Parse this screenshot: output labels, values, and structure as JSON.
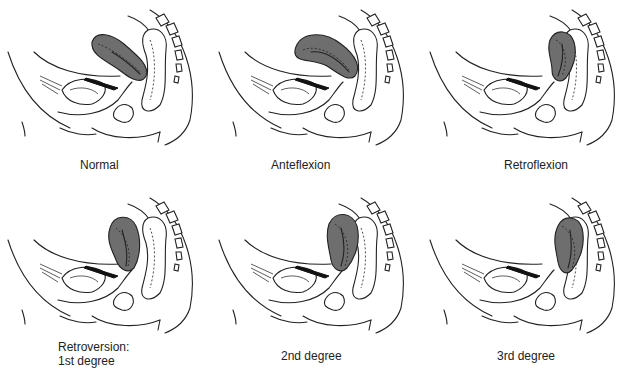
{
  "figure": {
    "panels": [
      {
        "id": "normal",
        "label": "Normal",
        "uterus_position": "normal"
      },
      {
        "id": "anteflexion",
        "label": "Anteflexion",
        "uterus_position": "anteflexion"
      },
      {
        "id": "retroflexion",
        "label": "Retroflexion",
        "uterus_position": "retroflexion"
      },
      {
        "id": "retroversion-1",
        "label": "Retroversion:\n1st degree",
        "uterus_position": "retroversion-1st"
      },
      {
        "id": "retroversion-2",
        "label": "2nd degree",
        "uterus_position": "retroversion-2nd"
      },
      {
        "id": "retroversion-3",
        "label": "3rd degree",
        "uterus_position": "retroversion-3rd"
      }
    ],
    "colors": {
      "uterus_fill": "#6e6e6e",
      "line": "#222222",
      "background": "#ffffff"
    }
  }
}
